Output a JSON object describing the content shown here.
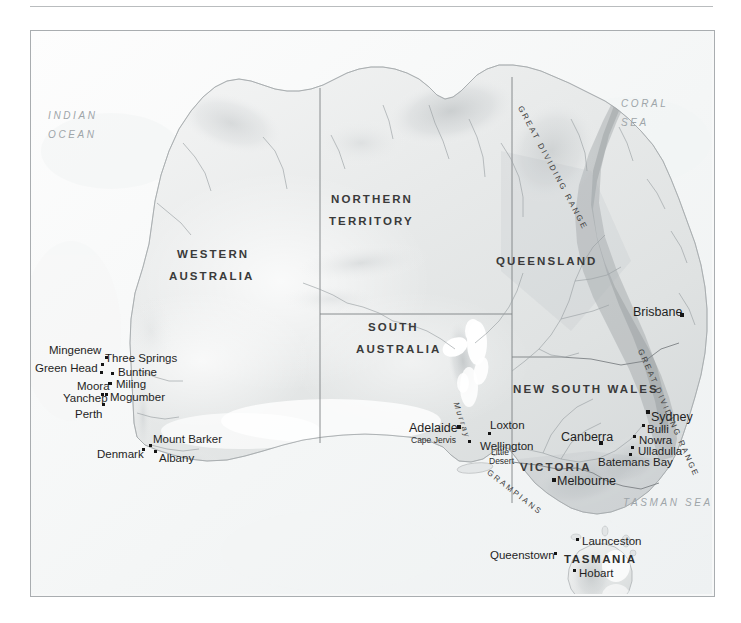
{
  "map": {
    "title": "Australia shaded relief map",
    "frame_color": "#a9adb0",
    "land_color": "#e9ebec",
    "ocean_color": "#fbfcfc",
    "border_color": "#7d8184",
    "river_color": "#9aa0a4",
    "marker_color": "#151515"
  },
  "seas": [
    {
      "name": "INDIAN OCEAN",
      "line1": "INDIAN",
      "line2": "OCEAN",
      "x": 47,
      "y": 110
    },
    {
      "name": "CORAL SEA",
      "line1": "CORAL",
      "line2": "SEA",
      "x": 620,
      "y": 98
    },
    {
      "name": "TASMAN SEA",
      "line1": "TASMAN SEA",
      "line2": "",
      "x": 622,
      "y": 497
    }
  ],
  "states": [
    {
      "label": "WESTERN",
      "x": 176,
      "y": 248
    },
    {
      "label": "AUSTRALIA",
      "x": 168,
      "y": 270
    },
    {
      "label": "NORTHERN",
      "x": 330,
      "y": 193
    },
    {
      "label": "TERRITORY",
      "x": 328,
      "y": 215
    },
    {
      "label": "QUEENSLAND",
      "x": 495,
      "y": 255
    },
    {
      "label": "SOUTH",
      "x": 367,
      "y": 321
    },
    {
      "label": "AUSTRALIA",
      "x": 355,
      "y": 343
    },
    {
      "label": "NEW SOUTH WALES",
      "x": 512,
      "y": 383
    },
    {
      "label": "VICTORIA",
      "x": 519,
      "y": 461
    },
    {
      "label": "TASMANIA",
      "x": 563,
      "y": 553
    }
  ],
  "ranges": [
    {
      "label": "GREAT DIVIDING RANGE",
      "x": 519,
      "y": 101,
      "rotate": 62
    },
    {
      "label": "GREAT DIVIDING RANGE",
      "x": 639,
      "y": 344,
      "rotate": 66
    },
    {
      "label": "GRAMPIANS",
      "x": 487,
      "y": 466,
      "rotate": 38
    },
    {
      "label": "Murray",
      "x": 455,
      "y": 397,
      "rotate": 72
    }
  ],
  "cities": [
    {
      "name": "Mingenew",
      "lx": 48,
      "ly": 344,
      "dx": 104,
      "dy": 355,
      "size": "sm"
    },
    {
      "name": "Three Springs",
      "lx": 104,
      "ly": 352,
      "dx": 100,
      "dy": 362,
      "size": "sm"
    },
    {
      "name": "Green Head",
      "lx": 34,
      "ly": 362,
      "dx": 99,
      "dy": 370,
      "size": "sm"
    },
    {
      "name": "Buntine",
      "lx": 117,
      "ly": 366,
      "dx": 110,
      "dy": 371,
      "size": "sm"
    },
    {
      "name": "Moora",
      "lx": 76,
      "ly": 380,
      "dx": 107,
      "dy": 381,
      "size": "sm"
    },
    {
      "name": "Miling",
      "lx": 115,
      "ly": 378,
      "dx": 108,
      "dy": 381,
      "size": "sm"
    },
    {
      "name": "Yanchep",
      "lx": 62,
      "ly": 392,
      "dx": 100,
      "dy": 392,
      "size": "sm"
    },
    {
      "name": "Mogumber",
      "lx": 109,
      "ly": 391,
      "dx": 104,
      "dy": 392,
      "size": "sm"
    },
    {
      "name": "Perth",
      "lx": 74,
      "ly": 408,
      "dx": 101,
      "dy": 402,
      "size": "sm"
    },
    {
      "name": "Mount Barker",
      "lx": 152,
      "ly": 433,
      "dx": 148,
      "dy": 443,
      "size": "sm"
    },
    {
      "name": "Denmark",
      "lx": 96,
      "ly": 448,
      "dx": 141,
      "dy": 447,
      "size": "sm"
    },
    {
      "name": "Albany",
      "lx": 158,
      "ly": 452,
      "dx": 153,
      "dy": 449,
      "size": "sm"
    },
    {
      "name": "Brisbane",
      "lx": 632,
      "ly": 305,
      "dx": 679,
      "dy": 312,
      "size": "cap"
    },
    {
      "name": "Adelaide",
      "lx": 408,
      "ly": 421,
      "dx": 456,
      "dy": 424,
      "size": "cap"
    },
    {
      "name": "Loxton",
      "lx": 489,
      "ly": 419,
      "dx": 487,
      "dy": 431,
      "size": "sm"
    },
    {
      "name": "Wellington",
      "lx": 479,
      "ly": 440,
      "dx": 467,
      "dy": 439,
      "size": "sm"
    },
    {
      "name": "Canberra",
      "lx": 560,
      "ly": 430,
      "dx": 598,
      "dy": 440,
      "size": "cap"
    },
    {
      "name": "Sydney",
      "lx": 650,
      "ly": 410,
      "dx": 645,
      "dy": 409,
      "size": "cap"
    },
    {
      "name": "Bulli",
      "lx": 646,
      "ly": 423,
      "dx": 641,
      "dy": 423,
      "size": "sm"
    },
    {
      "name": "Nowra",
      "lx": 638,
      "ly": 434,
      "dx": 632,
      "dy": 434,
      "size": "sm"
    },
    {
      "name": "Ulladulla",
      "lx": 637,
      "ly": 445,
      "dx": 630,
      "dy": 445,
      "size": "sm"
    },
    {
      "name": "Batemans Bay",
      "lx": 597,
      "ly": 456,
      "dx": 628,
      "dy": 452,
      "size": "sm"
    },
    {
      "name": "Melbourne",
      "lx": 556,
      "ly": 474,
      "dx": 551,
      "dy": 477,
      "size": "cap"
    },
    {
      "name": "Launceston",
      "lx": 581,
      "ly": 535,
      "dx": 575,
      "dy": 537,
      "size": "sm"
    },
    {
      "name": "Queenstown",
      "lx": 489,
      "ly": 549,
      "dx": 553,
      "dy": 551,
      "size": "sm"
    },
    {
      "name": "Hobart",
      "lx": 578,
      "ly": 567,
      "dx": 572,
      "dy": 568,
      "size": "sm"
    }
  ],
  "minor_labels": [
    {
      "label": "Cape Jervis",
      "x": 410,
      "y": 435
    },
    {
      "label": "Little",
      "x": 490,
      "y": 447
    },
    {
      "label": "Desert",
      "x": 488,
      "y": 456
    }
  ]
}
